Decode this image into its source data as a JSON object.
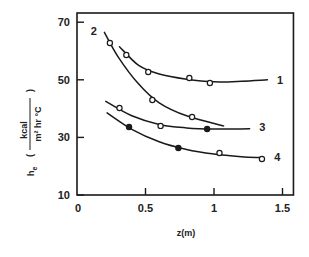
{
  "chart_data": {
    "type": "line",
    "title": "",
    "xlabel": "z(m)",
    "ylabel": "h_e (kcal / m² hr °C)",
    "ylabel_parts": {
      "symbol": "h",
      "subscript": "e",
      "numerator": "kcal",
      "denominator": "m² hr °C"
    },
    "xlim": [
      0,
      1.58
    ],
    "ylim": [
      10,
      73
    ],
    "x_ticks": [
      0,
      0.5,
      1,
      1.5
    ],
    "x_tick_labels": [
      "0",
      "0.5",
      "1",
      "1.5"
    ],
    "y_ticks": [
      10,
      30,
      50,
      70
    ],
    "y_tick_labels": [
      "10",
      "30",
      "50",
      "70"
    ],
    "grid": false,
    "legend": "inline curve labels",
    "series": [
      {
        "name": "1",
        "curve": [
          [
            0.31,
            61.5
          ],
          [
            0.45,
            55.0
          ],
          [
            0.6,
            52.0
          ],
          [
            0.8,
            50.2
          ],
          [
            1.0,
            49.3
          ],
          [
            1.2,
            49.5
          ],
          [
            1.39,
            50.0
          ]
        ],
        "points": [
          {
            "x": 0.36,
            "y": 58.6,
            "marker": "open"
          },
          {
            "x": 0.52,
            "y": 52.7,
            "marker": "open"
          },
          {
            "x": 0.82,
            "y": 50.6,
            "marker": "open"
          },
          {
            "x": 0.97,
            "y": 48.9,
            "marker": "open"
          }
        ]
      },
      {
        "name": "2",
        "curve": [
          [
            0.2,
            66.5
          ],
          [
            0.3,
            58.0
          ],
          [
            0.45,
            48.5
          ],
          [
            0.6,
            42.0
          ],
          [
            0.8,
            37.5
          ],
          [
            1.07,
            34.0
          ]
        ],
        "points": [
          {
            "x": 0.24,
            "y": 62.8,
            "marker": "open"
          },
          {
            "x": 0.55,
            "y": 43.0,
            "marker": "open"
          },
          {
            "x": 0.84,
            "y": 37.1,
            "marker": "open"
          }
        ]
      },
      {
        "name": "3",
        "curve": [
          [
            0.21,
            42.5
          ],
          [
            0.4,
            37.5
          ],
          [
            0.6,
            34.5
          ],
          [
            0.8,
            33.3
          ],
          [
            1.0,
            32.9
          ],
          [
            1.26,
            33.0
          ]
        ],
        "points": [
          {
            "x": 0.31,
            "y": 40.2,
            "marker": "open"
          },
          {
            "x": 0.61,
            "y": 34.0,
            "marker": "open"
          },
          {
            "x": 0.95,
            "y": 32.9,
            "marker": "filled"
          }
        ]
      },
      {
        "name": "4",
        "curve": [
          [
            0.22,
            38.5
          ],
          [
            0.4,
            32.8
          ],
          [
            0.6,
            28.5
          ],
          [
            0.8,
            25.8
          ],
          [
            1.0,
            24.2
          ],
          [
            1.2,
            23.3
          ],
          [
            1.35,
            23.0
          ]
        ],
        "points": [
          {
            "x": 0.38,
            "y": 33.6,
            "marker": "filled"
          },
          {
            "x": 0.74,
            "y": 26.3,
            "marker": "filled"
          },
          {
            "x": 1.04,
            "y": 24.6,
            "marker": "open"
          },
          {
            "x": 1.35,
            "y": 22.5,
            "marker": "open"
          }
        ]
      }
    ],
    "curve_label_positions": [
      {
        "name": "1",
        "x": 1.46,
        "y": 50.0
      },
      {
        "name": "2",
        "x": 0.1,
        "y": 67.0
      },
      {
        "name": "3",
        "x": 1.33,
        "y": 33.6
      },
      {
        "name": "4",
        "x": 1.44,
        "y": 23.3
      }
    ]
  },
  "colors": {
    "ink": "#1a1a1a",
    "background": "#ffffff"
  }
}
